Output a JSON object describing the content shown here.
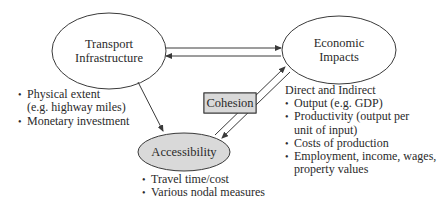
{
  "nodes": {
    "transport": {
      "line1": "Transport",
      "line2": "Infrastructure"
    },
    "economic": {
      "line1": "Economic",
      "line2": "Impacts"
    },
    "accessibility": {
      "label": "Accessibility",
      "fill": "#d9d9d9"
    },
    "cohesion": {
      "label": "Cohesion",
      "fill": "#d9d9d9"
    }
  },
  "transport_list": {
    "items": [
      "Physical extent",
      "(e.g. highway miles)",
      "Monetary investment"
    ]
  },
  "accessibility_list": {
    "items": [
      "Travel time/cost",
      "Various nodal measures"
    ]
  },
  "economic_list": {
    "heading": "Direct and Indirect",
    "items": [
      "Output (e.g. GDP)",
      "Productivity (output per",
      "unit of input)",
      "Costs of production",
      "Employment, income, wages,",
      "property values"
    ]
  },
  "colors": {
    "stroke": "#3a3a3a",
    "shade": "#d9d9d9"
  }
}
